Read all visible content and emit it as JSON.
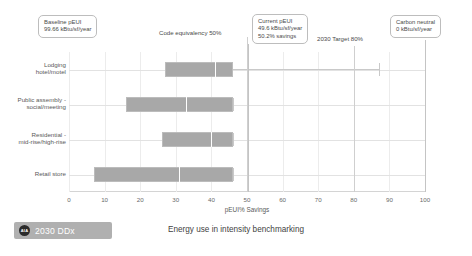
{
  "caption": "Energy use in intensity benchmarking",
  "footer": {
    "badge_logo": "AIA",
    "badge_label": "2030 DDx"
  },
  "callouts": {
    "baseline": {
      "title": "Baseline pEUI",
      "value": "99.66 kBtu/sf/year",
      "text": "Baseline pEUI\n99.66 kBtu/sf/year",
      "at_value": 0
    },
    "current": {
      "title": "Current pEUI",
      "value": "49.6 kBtu/sf/year",
      "savings": "50.2% savings",
      "text": "Current pEUI\n49.6 kBtu/sf/year\n50.2% savings",
      "at_value": 50.2
    },
    "carbon_neutral": {
      "title": "Carbon neutral",
      "value": "0 kBtu/sf/year",
      "text": "Carbon neutral\n0 kBtu/sf/year",
      "at_value": 100
    },
    "code_equivalency": {
      "text": "Code equivalency 50%",
      "at_value": 50
    },
    "target_2030": {
      "text": "2030 Target 80%",
      "at_value": 80
    }
  },
  "chart_data": {
    "type": "bar",
    "subtype": "box-plot-horizontal",
    "title": "Energy use in intensity benchmarking",
    "xlabel": "pEUI% Savings",
    "ylabel": "",
    "xlim": [
      0,
      100
    ],
    "xticks": [
      0,
      10,
      20,
      30,
      40,
      50,
      60,
      70,
      80,
      90,
      100
    ],
    "xticklabels": [
      "0",
      "10",
      "20",
      "30",
      "40",
      "50",
      "60",
      "70",
      "80",
      "90",
      "100"
    ],
    "grid": true,
    "legend": "none",
    "bar_color": "#a8a8a8",
    "median_color": "#ffffff",
    "categories": [
      "Lodging\nhotel/motel",
      "Public assembly -\nsocial/meeting",
      "Residential -\nmid-rise/high-rise",
      "Retail store"
    ],
    "boxes": [
      {
        "category": "Lodging hotel/motel",
        "whisker_low": 27,
        "q1": 27,
        "median": 41,
        "q3": 46,
        "whisker_high": 87
      },
      {
        "category": "Public assembly - social/meeting",
        "whisker_low": 16,
        "q1": 16,
        "median": 33,
        "q3": 46,
        "whisker_high": 46
      },
      {
        "category": "Residential - mid-rise/high-rise",
        "whisker_low": 26,
        "q1": 26,
        "median": 40,
        "q3": 46,
        "whisker_high": 46
      },
      {
        "category": "Retail store",
        "whisker_low": 7,
        "q1": 7,
        "median": 31,
        "q3": 46,
        "whisker_high": 46
      }
    ],
    "reference_lines": [
      {
        "label": "Code equivalency 50%",
        "value": 50
      },
      {
        "label": "Current pEUI 50.2% savings",
        "value": 50.2
      },
      {
        "label": "2030 Target 80%",
        "value": 80
      },
      {
        "label": "Carbon neutral",
        "value": 100
      }
    ]
  }
}
